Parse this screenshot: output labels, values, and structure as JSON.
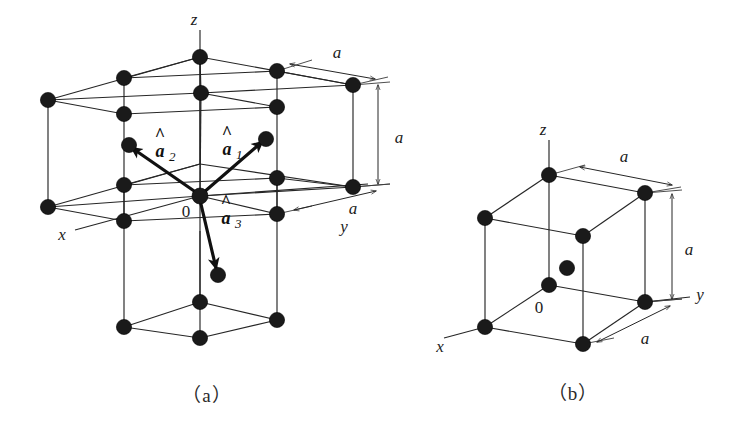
{
  "figure": {
    "background_color": "#ffffff",
    "line_color": "#262626",
    "node_color": "#1a1a1a",
    "vector_color": "#101010"
  },
  "panel_a": {
    "caption": "（a）",
    "axes": [
      {
        "name": "z",
        "label": "z"
      },
      {
        "name": "x",
        "label": "x"
      },
      {
        "name": "y",
        "label": "y"
      }
    ],
    "origin_label": "0",
    "vectors": [
      {
        "name": "a1",
        "base": "a",
        "hat": "^",
        "sub": "1"
      },
      {
        "name": "a2",
        "base": "a",
        "hat": "^",
        "sub": "2"
      },
      {
        "name": "a3",
        "base": "a",
        "hat": "^",
        "sub": "3"
      }
    ],
    "dimensions": [
      {
        "name": "top-edge",
        "label": "a"
      },
      {
        "name": "vertical-edge",
        "label": "a"
      },
      {
        "name": "bottom-edge",
        "label": "a"
      }
    ]
  },
  "panel_b": {
    "caption": "（b）",
    "axes": [
      {
        "name": "z",
        "label": "z"
      },
      {
        "name": "x",
        "label": "x"
      },
      {
        "name": "y",
        "label": "y"
      }
    ],
    "origin_label": "0",
    "dimensions": [
      {
        "name": "top-edge",
        "label": "a"
      },
      {
        "name": "vertical-edge",
        "label": "a"
      },
      {
        "name": "bottom-edge",
        "label": "a"
      }
    ]
  }
}
